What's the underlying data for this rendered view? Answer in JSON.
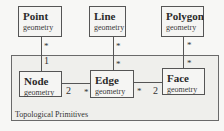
{
  "diagram": {
    "container": {
      "label": "Topological Primitives"
    },
    "geometry_boxes": [
      {
        "title": "Point",
        "subtitle": "geometry"
      },
      {
        "title": "Line",
        "subtitle": "geometry"
      },
      {
        "title": "Polygon",
        "subtitle": "geometry"
      }
    ],
    "primitive_boxes": [
      {
        "title": "Node",
        "subtitle": "geometry"
      },
      {
        "title": "Edge",
        "subtitle": "geometry"
      },
      {
        "title": "Face",
        "subtitle": "geometry"
      }
    ],
    "associations": [
      {
        "from": "Point",
        "to": "Node",
        "from_mult": "*",
        "to_mult": "1"
      },
      {
        "from": "Line",
        "to": "Edge",
        "from_mult": "*",
        "to_mult": "*"
      },
      {
        "from": "Polygon",
        "to": "Face",
        "from_mult": "*",
        "to_mult": "*"
      },
      {
        "from": "Node",
        "to": "Edge",
        "from_mult": "2",
        "to_mult": "*"
      },
      {
        "from": "Edge",
        "to": "Face",
        "from_mult": "*",
        "to_mult": "2"
      }
    ]
  }
}
